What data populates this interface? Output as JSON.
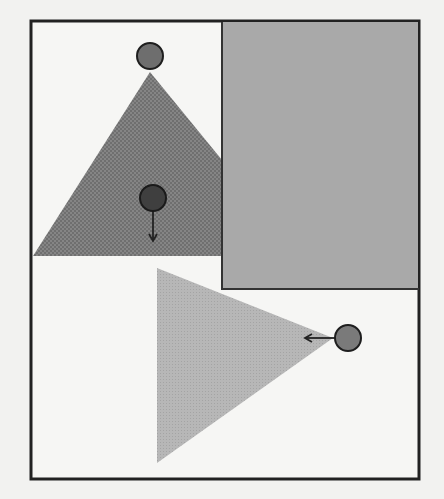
{
  "figure": {
    "frame": {
      "x": 30,
      "y": 20,
      "width": 389,
      "height": 460,
      "stroke": "#222222",
      "fill": "#f6f6f4"
    },
    "gray_rectangle": {
      "x": 222,
      "y": 22,
      "width": 197,
      "height": 266,
      "fill": "#a9a9a9",
      "stroke": "#333333"
    },
    "upper_triangle": {
      "points": "150,72 33,256 222,256 222,160",
      "fill": "#7d7d7d",
      "pattern": "dense-hatch"
    },
    "lower_triangle": {
      "points": "157,268 333,338 157,463",
      "fill": "#b3b3b3",
      "pattern": "light-stipple"
    },
    "circles": [
      {
        "id": "apex-circle",
        "cx": 150,
        "cy": 56,
        "r": 13,
        "fill": "#6e6e6e"
      },
      {
        "id": "inner-circle",
        "cx": 153,
        "cy": 198,
        "r": 13,
        "fill": "#3f3f3f",
        "arrow": {
          "direction": "down",
          "x1": 153,
          "y1": 211,
          "x2": 153,
          "y2": 241
        }
      },
      {
        "id": "right-circle",
        "cx": 348,
        "cy": 338,
        "r": 13,
        "fill": "#7a7a7a",
        "arrow": {
          "direction": "left",
          "x1": 335,
          "y1": 338,
          "x2": 305,
          "y2": 338
        }
      }
    ]
  }
}
